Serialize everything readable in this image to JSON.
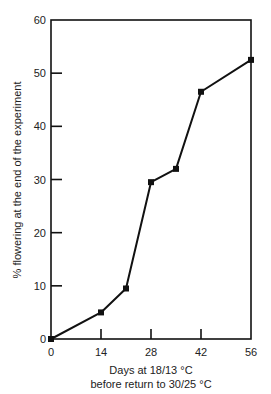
{
  "chart_data": {
    "type": "line",
    "title": "",
    "xlabel": "Days at 18/13 °C",
    "xlabel_line2": "before return to 30/25 °C",
    "ylabel": "% flowering at the end of the experiment",
    "xlim": [
      0,
      56
    ],
    "ylim": [
      0,
      60
    ],
    "x_ticks": [
      0,
      14,
      28,
      42,
      56
    ],
    "y_ticks": [
      0,
      10,
      20,
      30,
      40,
      50,
      60
    ],
    "grid": false,
    "legend": null,
    "series": [
      {
        "name": "% flowering",
        "marker": "square",
        "color": "#111111",
        "x": [
          0,
          14,
          21,
          28,
          35,
          42,
          56
        ],
        "y": [
          0,
          5,
          9.5,
          29.5,
          32,
          46.5,
          52.5
        ]
      }
    ]
  }
}
